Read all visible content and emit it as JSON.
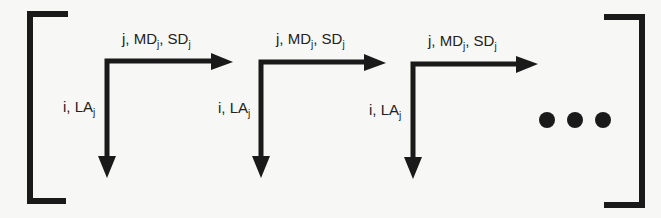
{
  "diagram": {
    "type": "matrix-of-axis-arrows",
    "colors": {
      "ink": "#1a1a1a",
      "background": "#f7f7f5"
    },
    "brackets": {
      "left": "[",
      "right": "]"
    },
    "blocks": [
      {
        "horizontal_label": {
          "base": "j, MD",
          "sub1": "j",
          "mid": ", SD",
          "sub2": "j"
        },
        "vertical_label": {
          "base": "i, LA",
          "sub": "j"
        }
      },
      {
        "horizontal_label": {
          "base": "j, MD",
          "sub1": "j",
          "mid": ", SD",
          "sub2": "j"
        },
        "vertical_label": {
          "base": "i, LA",
          "sub": "j"
        }
      },
      {
        "horizontal_label": {
          "base": "j, MD",
          "sub1": "j",
          "mid": ", SD",
          "sub2": "j"
        },
        "vertical_label": {
          "base": "i, LA",
          "sub": "j"
        }
      }
    ],
    "continuation": "ellipsis-dots"
  }
}
